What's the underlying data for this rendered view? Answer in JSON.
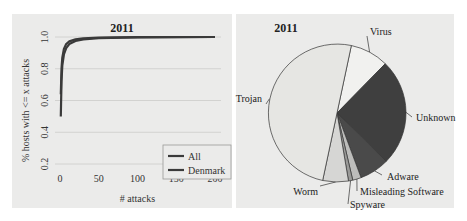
{
  "chart_data": [
    {
      "type": "line",
      "title": "2011",
      "xlabel": "# attacks",
      "ylabel": "% hosts with <= x attacks",
      "xlim": [
        0,
        200
      ],
      "ylim": [
        0.2,
        1.0
      ],
      "xticks": [
        "0",
        "50",
        "100",
        "150",
        "200"
      ],
      "yticks": [
        "0.2",
        "0.4",
        "0.6",
        "0.8",
        "1.0"
      ],
      "grid": true,
      "legend_position": "bottom-right",
      "series": [
        {
          "name": "All",
          "color": "#3a3a3a",
          "x": [
            1,
            2,
            3,
            5,
            8,
            12,
            20,
            30,
            50,
            100,
            200
          ],
          "y": [
            0.5,
            0.72,
            0.82,
            0.89,
            0.93,
            0.955,
            0.975,
            0.985,
            0.993,
            0.998,
            1.0
          ]
        },
        {
          "name": "Denmark",
          "color": "#3a3a3a",
          "x": [
            1,
            2,
            3,
            5,
            8,
            12,
            20,
            30,
            50,
            100,
            200
          ],
          "y": [
            0.64,
            0.8,
            0.87,
            0.925,
            0.955,
            0.972,
            0.985,
            0.992,
            0.996,
            0.999,
            1.0
          ]
        }
      ]
    },
    {
      "type": "pie",
      "title": "2011",
      "slices": [
        {
          "label": "Virus",
          "value": 9,
          "color": "#f1f1ef"
        },
        {
          "label": "Unknown",
          "value": 25,
          "color": "#3f3f3f"
        },
        {
          "label": "Adware",
          "value": 7,
          "color": "#4a4a4a"
        },
        {
          "label": "Misleading Software",
          "value": 2,
          "color": "#bdbdbb"
        },
        {
          "label": "Spyware",
          "value": 1,
          "color": "#9a9a98"
        },
        {
          "label": "Worm",
          "value": 6,
          "color": "#d6d6d4"
        },
        {
          "label": "Trojan",
          "value": 50,
          "color": "#e6e6e3"
        }
      ]
    }
  ],
  "left": {
    "title": "2011",
    "xlabel": "# attacks",
    "ylabel": "% hosts with <= x attacks",
    "legend": [
      "All",
      "Denmark"
    ]
  },
  "right": {
    "title": "2011"
  }
}
